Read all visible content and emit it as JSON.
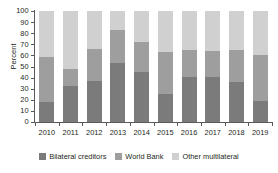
{
  "chart_data": {
    "type": "bar",
    "subtype": "stacked-100",
    "title": "",
    "xlabel": "",
    "ylabel": "Percent",
    "ylim": [
      0,
      100
    ],
    "yticks": [
      0,
      10,
      20,
      30,
      40,
      50,
      60,
      70,
      80,
      90,
      100
    ],
    "grid": false,
    "legend_position": "bottom",
    "categories": [
      "2010",
      "2011",
      "2012",
      "2013",
      "2014",
      "2015",
      "2016",
      "2017",
      "2018",
      "2019"
    ],
    "series": [
      {
        "name": "Bilateral creditors",
        "color": "#7b7b7b",
        "values": [
          18,
          32,
          37,
          53,
          45.5,
          25.5,
          41,
          41,
          36,
          19
        ]
      },
      {
        "name": "World Bank",
        "color": "#9e9e9e",
        "values": [
          41,
          16,
          29,
          30,
          27,
          37.5,
          24,
          23,
          28.5,
          41.5
        ]
      },
      {
        "name": "Other multilateral",
        "color": "#d0d0d0",
        "values": [
          41,
          52,
          34,
          17,
          27.5,
          37,
          35,
          36,
          35.5,
          39.5
        ]
      }
    ],
    "cumulative_tops": {
      "bilateral": [
        18,
        32,
        37,
        53,
        45.5,
        25.5,
        41,
        41,
        36,
        19
      ],
      "plus_world_bank": [
        59,
        48,
        66,
        83,
        72.5,
        63,
        65,
        64,
        64.5,
        60.5
      ],
      "total": [
        100,
        100,
        100,
        100,
        100,
        100,
        100,
        100,
        100,
        100
      ]
    }
  },
  "axis": {
    "y_title": "Percent"
  },
  "legend": {
    "items": [
      {
        "label": "Bilateral creditors",
        "color": "#7b7b7b"
      },
      {
        "label": "World Bank",
        "color": "#9e9e9e"
      },
      {
        "label": "Other multilateral",
        "color": "#d0d0d0"
      }
    ]
  }
}
